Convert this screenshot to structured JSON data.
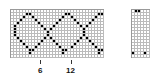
{
  "main_chart": {
    "cols": 31,
    "rows": 16,
    "pattern": [
      "0000000000000000000000000000000",
      "0000011000000000001100000000011",
      "0000100100000000010010000000100",
      "0001000010000000100001000001000",
      "0010000001000001000000100010000",
      "0100000000100010000000010100000",
      "0100000000010100000000001000000",
      "0100000000001000000000001000000",
      "0100000000001000000000001000000",
      "0010000000010100000000010100000",
      "0001000000100010000000100010000",
      "0000100001000001000001000001000",
      "0000010010000000100010000000100",
      "0000001100000000011000000000011",
      "0000001000000000010000000000010",
      "0000000000000000000000000000000"
    ]
  },
  "side_chart": {
    "cols": 6,
    "rows": 16,
    "pattern": [
      "011000",
      "000000",
      "000000",
      "000000",
      "000000",
      "000000",
      "000000",
      "000000",
      "000000",
      "000000",
      "000000",
      "000000",
      "000000",
      "000000",
      "100010",
      "000000"
    ]
  },
  "axis": {
    "labels": [
      {
        "text": "6",
        "col": 6
      },
      {
        "text": "12",
        "col": 12
      }
    ]
  }
}
